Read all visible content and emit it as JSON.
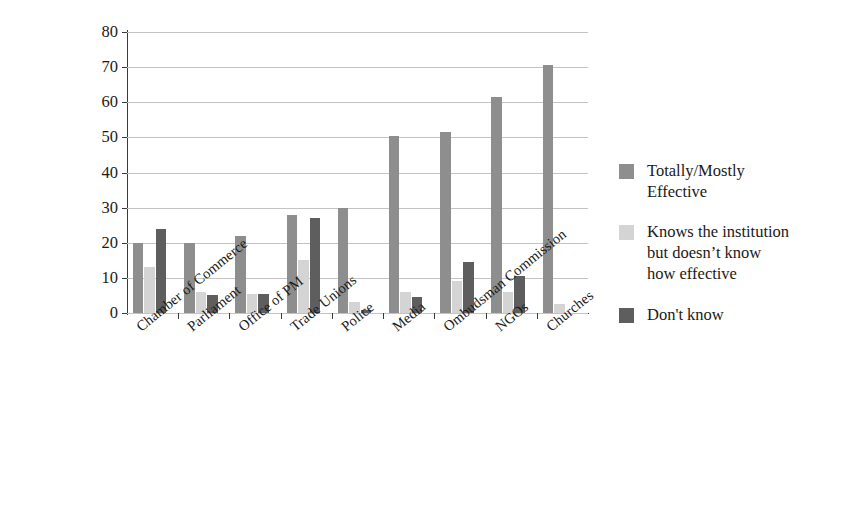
{
  "chart_data": {
    "type": "bar",
    "title": "",
    "subtitle": "",
    "xlabel": "",
    "ylabel": "",
    "ylim": [
      0,
      80
    ],
    "ytick_step": 10,
    "yticks": [
      "80",
      "70",
      "60",
      "50",
      "40",
      "30",
      "20",
      "10",
      "0"
    ],
    "grid": true,
    "grid_axis": "y",
    "legend_position": "right",
    "orientation": "vertical",
    "grouping": "grouped",
    "categories": [
      "Chamber of Commerce",
      "Parliament",
      "Office of PM",
      "Trade Unions",
      "Police",
      "Media",
      "Ombudsman Commission",
      "NGOs",
      "Churches"
    ],
    "series": [
      {
        "name": "Totally/Mostly Effective",
        "color": "#8e8e8e",
        "values": [
          20,
          20,
          22,
          28,
          30,
          50.5,
          51.5,
          61.5,
          70.5
        ]
      },
      {
        "name": "Knows the institution but doesn't know how effective",
        "color": "#d4d4d4",
        "values": [
          13,
          6,
          5.5,
          15,
          3,
          6,
          9,
          6,
          2.5
        ]
      },
      {
        "name": "Don't know",
        "color": "#5e5e5e",
        "values": [
          24,
          5,
          5.5,
          27,
          1,
          4.5,
          14.5,
          10.5,
          0
        ]
      }
    ]
  },
  "legend": {
    "entries": [
      {
        "label": "Totally/Mostly\nEffective",
        "color": "#8e8e8e"
      },
      {
        "label": "Knows the institution\nbut doesn’t know\nhow effective",
        "color": "#d4d4d4"
      },
      {
        "label": "Don't know",
        "color": "#5e5e5e"
      }
    ]
  }
}
